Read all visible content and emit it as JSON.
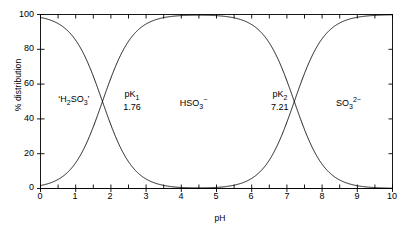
{
  "chart_data": {
    "type": "line",
    "title": "",
    "xlabel": "pH",
    "ylabel": "% distribution",
    "xlim": [
      0,
      10
    ],
    "ylim": [
      0,
      100
    ],
    "xticks": [
      0,
      1,
      2,
      3,
      4,
      5,
      6,
      7,
      8,
      9,
      10
    ],
    "xtick_labels": [
      "0",
      "1",
      "2",
      "3",
      "4",
      "5",
      "6",
      "7",
      "8",
      "9",
      "10"
    ],
    "minor_xtick_step": 0.5,
    "yticks": [
      0,
      20,
      40,
      60,
      80,
      100
    ],
    "ytick_labels": [
      "0",
      "20",
      "40",
      "60",
      "80",
      "100"
    ],
    "grid": false,
    "legend": "none",
    "frame": "box",
    "tick_direction": "in",
    "line_color": "#000000",
    "line_width": 0.9,
    "pk_values": [
      1.76,
      7.21
    ],
    "series": [
      {
        "name": "'H2SO3'",
        "label_html": "&lsquo;H<sub>2</sub>SO<sub>3</sub>&rsquo;",
        "label_x": 0.95,
        "label_y": 50,
        "x": [
          0,
          0.25,
          0.5,
          0.75,
          1,
          1.25,
          1.5,
          1.76,
          2,
          2.25,
          2.5,
          2.75,
          3,
          3.5,
          4,
          4.5,
          5,
          6,
          7,
          8,
          9,
          10
        ],
        "values": [
          98.3,
          97.0,
          94.8,
          91.1,
          85.2,
          76.4,
          64.6,
          50.0,
          36.5,
          24.7,
          15.4,
          9.2,
          5.4,
          1.8,
          0.6,
          0.2,
          0.1,
          0.0,
          0.0,
          0.0,
          0.0,
          0.0
        ]
      },
      {
        "name": "HSO3-",
        "label_html": "HSO<sub>3</sub><sup>&minus;</sup>",
        "label_x": 4.35,
        "label_y": 50,
        "x": [
          0,
          0.25,
          0.5,
          0.75,
          1,
          1.25,
          1.5,
          1.76,
          2,
          2.25,
          2.5,
          2.75,
          3,
          3.5,
          4,
          4.5,
          5,
          5.5,
          6,
          6.5,
          7,
          7.21,
          7.5,
          8,
          8.5,
          9,
          9.5,
          10
        ],
        "values": [
          1.7,
          3.0,
          5.2,
          8.9,
          14.8,
          23.6,
          35.4,
          50.0,
          63.5,
          75.3,
          84.6,
          90.7,
          94.5,
          98.2,
          99.4,
          99.8,
          99.9,
          100.0,
          99.9,
          99.8,
          99.4,
          50.0,
          32.9,
          13.4,
          4.6,
          1.5,
          0.5,
          0.2
        ]
      },
      {
        "name": "SO3 2-",
        "label_html": "SO<sub>3</sub><sup>2&minus;</sup>",
        "label_x": 8.75,
        "label_y": 50,
        "x": [
          0,
          3,
          5,
          6,
          6.5,
          7,
          7.21,
          7.5,
          8,
          8.5,
          9,
          9.5,
          10
        ],
        "values": [
          0.0,
          0.0,
          0.0,
          0.1,
          0.2,
          0.6,
          50.0,
          66.1,
          86.0,
          95.1,
          98.4,
          99.5,
          99.8
        ]
      }
    ],
    "annotations": [
      {
        "name": "pk1",
        "label_html": "pK<sub>1</sub>",
        "value_text": "1.76",
        "x": 2.6,
        "y": 50
      },
      {
        "name": "pk2",
        "label_html": "pK<sub>2</sub>",
        "value_text": "7.21",
        "x": 6.8,
        "y": 50
      }
    ]
  },
  "axes": {
    "y_title": "% distribution",
    "x_title": "pH",
    "y_labels": [
      "100",
      "80",
      "60",
      "40",
      "20",
      "0"
    ],
    "x_labels": [
      "0",
      "1",
      "2",
      "3",
      "4",
      "5",
      "6",
      "7",
      "8",
      "9",
      "10"
    ]
  },
  "labels": {
    "species_acid": "'H2SO3'",
    "species_mono": "HSO3-",
    "species_di": "SO3 2-",
    "pk1_name": "pK1",
    "pk1_value": "1.76",
    "pk2_name": "pK2",
    "pk2_value": "7.21"
  }
}
